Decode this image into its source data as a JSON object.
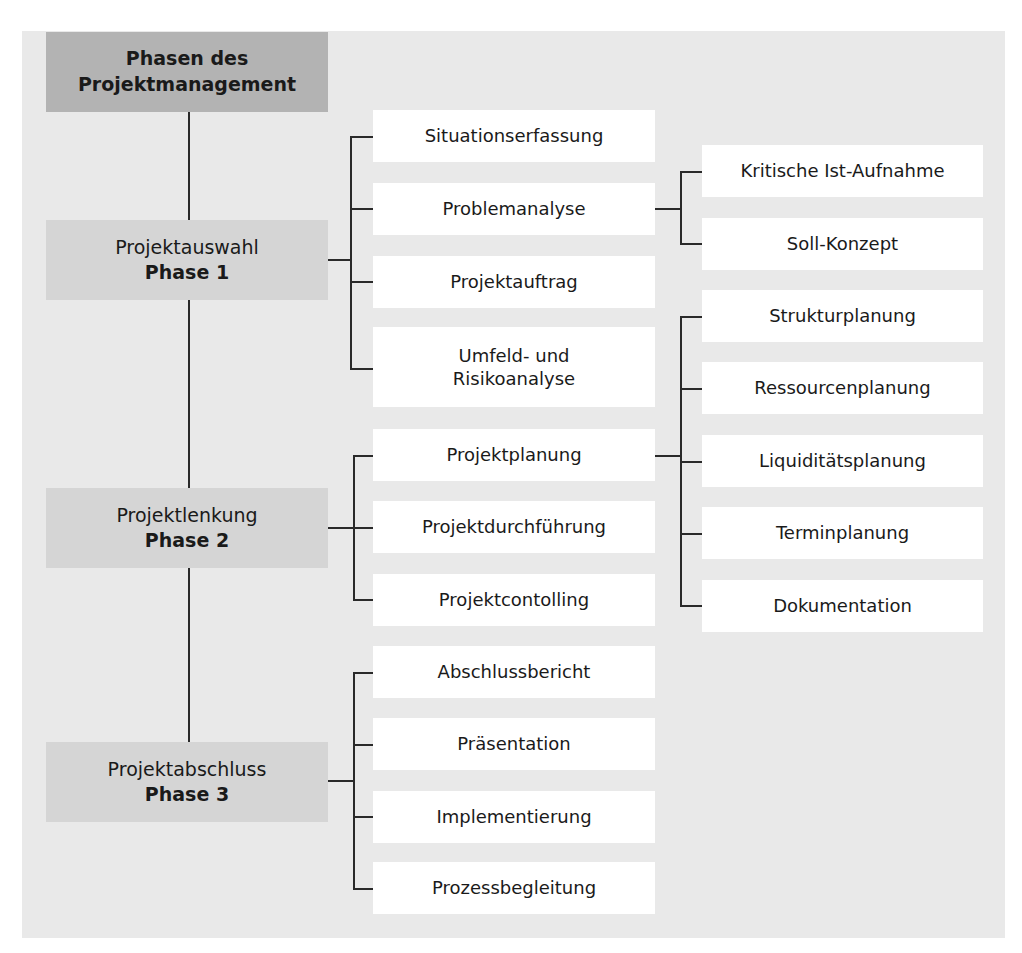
{
  "diagram": {
    "title_line1": "Phasen des",
    "title_line2": "Projektmanagement",
    "phases": [
      {
        "name": "Projektauswahl",
        "label": "Phase 1",
        "steps": [
          {
            "label": "Situationserfassung"
          },
          {
            "label": "Problemanalyse",
            "substeps": [
              "Kritische Ist-Aufnahme",
              "Soll-Konzept"
            ]
          },
          {
            "label": "Projektauftrag"
          },
          {
            "label_line1": "Umfeld- und",
            "label_line2": "Risikoanalyse"
          }
        ]
      },
      {
        "name": "Projektlenkung",
        "label": "Phase 2",
        "steps": [
          {
            "label": "Projektplanung",
            "substeps": [
              "Strukturplanung",
              "Ressourcenplanung",
              "Liquiditätsplanung",
              "Terminplanung",
              "Dokumentation"
            ]
          },
          {
            "label": "Projektdurchführung"
          },
          {
            "label": "Projektcontolling"
          }
        ]
      },
      {
        "name": "Projektabschluss",
        "label": "Phase 3",
        "steps": [
          {
            "label": "Abschlussbericht"
          },
          {
            "label": "Präsentation"
          },
          {
            "label": "Implementierung"
          },
          {
            "label": "Prozessbegleitung"
          }
        ]
      }
    ]
  },
  "colors": {
    "panel_bg": "#e9e9e9",
    "title_bg": "#b3b3b3",
    "phase_bg": "#d5d5d5",
    "node_bg": "#ffffff",
    "line": "#2a2a2a"
  }
}
